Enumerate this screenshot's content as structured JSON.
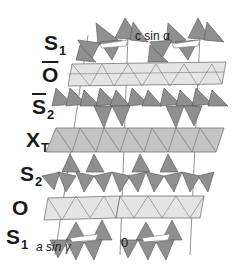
{
  "figure": {
    "type": "polyhedral crystal structure diagram",
    "colors": {
      "tetrahedra_fill": "#8f8f8f",
      "tetrahedra_stroke": "#555555",
      "octahedra_fill": "#e4e4e4",
      "xt_sheet_fill": "#c4c4c4",
      "edge_stroke": "#666666",
      "background": "#ffffff",
      "text": "#1a1a1a"
    }
  },
  "layers": [
    {
      "id": "S1_top",
      "main": "S",
      "sub": "1",
      "bar": false
    },
    {
      "id": "O_bar",
      "main": "O",
      "sub": "",
      "bar": true
    },
    {
      "id": "S2_bar",
      "main": "S",
      "sub": "2",
      "bar": true
    },
    {
      "id": "XT",
      "main": "X",
      "sub": "T",
      "bar": false
    },
    {
      "id": "S2",
      "main": "S",
      "sub": "2",
      "bar": false
    },
    {
      "id": "O",
      "main": "O",
      "sub": "",
      "bar": false
    },
    {
      "id": "S1_bottom",
      "main": "S",
      "sub": "1",
      "bar": false
    }
  ],
  "annotations": {
    "c_axis": "c sin α",
    "a_axis": "a sin γ",
    "origin": "0"
  }
}
